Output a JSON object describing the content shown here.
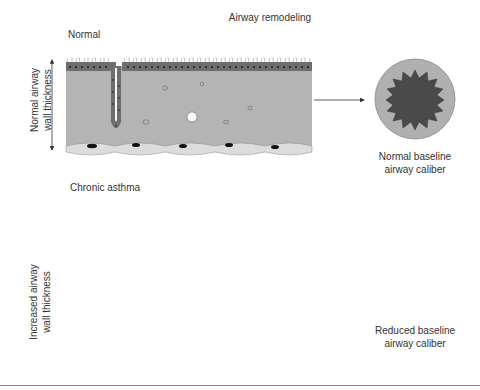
{
  "figure": {
    "title": "Airway remodeling",
    "panels": [
      {
        "label": "Normal",
        "thickness_label_line1": "Normal airway",
        "thickness_label_line2": "wall thickness",
        "caption_line1": "Normal baseline",
        "caption_line2": "airway caliber"
      },
      {
        "label": "Chronic asthma",
        "thickness_label_line1": "Increased airway",
        "thickness_label_line2": "wall thickness",
        "caption_line1": "Reduced baseline",
        "caption_line2": "airway caliber"
      }
    ]
  },
  "colors": {
    "epithelium": "#6e6e6e",
    "submucosa": "#b4b4b4",
    "smooth_muscle": "#dcdcdc",
    "nucleus": "#111111",
    "lumen_normal": "#4a4a4a",
    "wall_ring": "#b0b0b0",
    "mucus": "#c8c8c8"
  }
}
